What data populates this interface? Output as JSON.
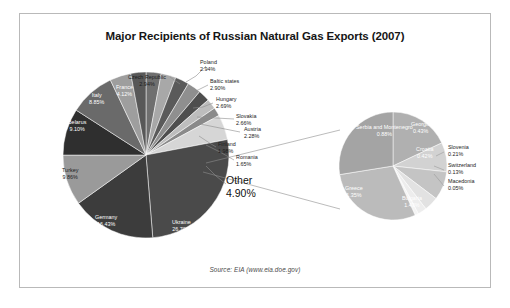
{
  "chart": {
    "title": "Major Recipients of Russian Natural Gas Exports (2007)",
    "source": "Source: EIA (www.eia.doe.gov)"
  },
  "chart_data": {
    "type": "pie",
    "title": "Major Recipients of Russian Natural Gas Exports (2007)",
    "subtitle": "",
    "xlabel": "",
    "ylabel": "",
    "legend_position": "none",
    "grid": false,
    "value_unit": "percent",
    "note": "Pie of pie: the 'Other' slice of the main pie is exploded into the secondary pie on the right.",
    "source": "Source: EIA (www.eia.doe.gov)",
    "categories": [
      "Ukraine",
      "Germany",
      "Turkey",
      "Belarus",
      "Italy",
      "France",
      "Czech Republic",
      "Poland",
      "Baltic states",
      "Hungary",
      "Slovakia",
      "Austria",
      "Finland",
      "Romania",
      "Other"
    ],
    "values": [
      26.7,
      16.43,
      9.86,
      9.1,
      8.85,
      4.12,
      2.94,
      2.94,
      2.9,
      2.69,
      2.66,
      2.28,
      1.98,
      1.65,
      4.9
    ],
    "secondary": {
      "type": "pie",
      "parent_category": "Other",
      "parent_value": 4.9,
      "categories": [
        "Bulgaria",
        "Greece",
        "Serbia and Montenegro",
        "Georgia",
        "Croatia",
        "Slovenia",
        "Switzerland",
        "Macedonia"
      ],
      "values": [
        1.43,
        1.35,
        0.88,
        0.43,
        0.42,
        0.21,
        0.13,
        0.05
      ]
    }
  },
  "main_pie": {
    "slices": [
      {
        "label": "Poland",
        "pct": "2.94%",
        "value": 2.94,
        "color": "#6f6f6f"
      },
      {
        "label": "Baltic states",
        "pct": "2.90%",
        "value": 2.9,
        "color": "#a8a8a8"
      },
      {
        "label": "Hungary",
        "pct": "2.69%",
        "value": 2.69,
        "color": "#5a5a5a"
      },
      {
        "label": "Slovakia",
        "pct": "2.66%",
        "value": 2.66,
        "color": "#8f8f8f"
      },
      {
        "label": "Austria",
        "pct": "2.28%",
        "value": 2.28,
        "color": "#4e4e4e"
      },
      {
        "label": "Finland",
        "pct": "1.98%",
        "value": 1.98,
        "color": "#bdbdbd"
      },
      {
        "label": "Romania",
        "pct": "1.65%",
        "value": 1.65,
        "color": "#8a8a8a"
      },
      {
        "label": "Other",
        "pct": "4.90%",
        "value": 4.9,
        "color": "#d6d6d6"
      },
      {
        "label": "Ukraine",
        "pct": "26.70%",
        "value": 26.7,
        "color": "#4a4a4a"
      },
      {
        "label": "Germany",
        "pct": "16.43%",
        "value": 16.43,
        "color": "#3c3c3c"
      },
      {
        "label": "Turkey",
        "pct": "9.86%",
        "value": 9.86,
        "color": "#9a9a9a"
      },
      {
        "label": "Belarus",
        "pct": "9.10%",
        "value": 9.1,
        "color": "#2f2f2f"
      },
      {
        "label": "Italy",
        "pct": "8.85%",
        "value": 8.85,
        "color": "#6a6a6a"
      },
      {
        "label": "France",
        "pct": "4.12%",
        "value": 4.12,
        "color": "#9e9e9e"
      },
      {
        "label": "Czech Republic",
        "pct": "2.94%",
        "value": 2.94,
        "color": "#585858"
      }
    ]
  },
  "other_pie": {
    "slices": [
      {
        "label": "Serbia and Montenegro",
        "pct": "0.88%",
        "value": 0.88,
        "color": "#b0b0b0"
      },
      {
        "label": "Georgia",
        "pct": "0.43%",
        "value": 0.43,
        "color": "#d2d2d2"
      },
      {
        "label": "Croatia",
        "pct": "0.42%",
        "value": 0.42,
        "color": "#c4c4c4"
      },
      {
        "label": "Slovenia",
        "pct": "0.21%",
        "value": 0.21,
        "color": "#e2e2e2"
      },
      {
        "label": "Switzerland",
        "pct": "0.13%",
        "value": 0.13,
        "color": "#ededed"
      },
      {
        "label": "Macedonia",
        "pct": "0.05%",
        "value": 0.05,
        "color": "#f4f4f4"
      },
      {
        "label": "Bulgaria",
        "pct": "1.43%",
        "value": 1.43,
        "color": "#bbbbbb"
      },
      {
        "label": "Greece",
        "pct": "1.35%",
        "value": 1.35,
        "color": "#a4a4a4"
      }
    ]
  },
  "other_callout": {
    "label": "Other",
    "pct": "4.90%"
  }
}
